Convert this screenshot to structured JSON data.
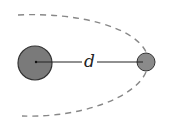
{
  "diagram": {
    "label_distance": "d",
    "colors": {
      "body_fill": "#7a7a7a",
      "outline": "#333333",
      "orbit": "#888888"
    },
    "bodies": [
      {
        "name": "large-body",
        "cx": 35,
        "cy": 63,
        "r": 17
      },
      {
        "name": "small-body",
        "cx": 146,
        "cy": 62,
        "r": 9
      }
    ]
  }
}
